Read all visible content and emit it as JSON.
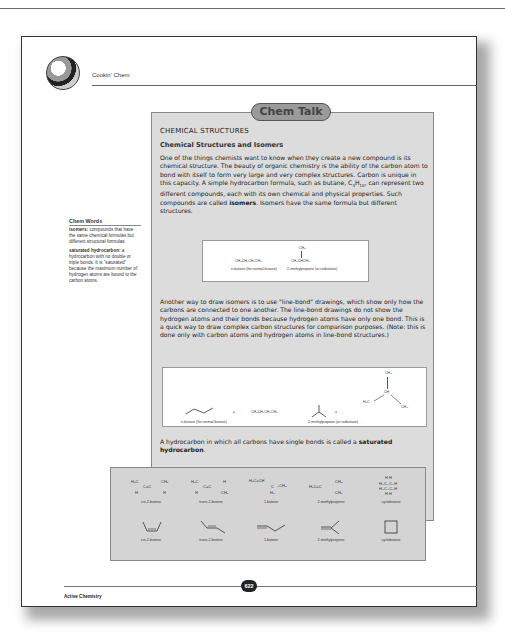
{
  "header": {
    "title": "Cookin' Chem",
    "logo_icon": "chef-knife-icon"
  },
  "chem_talk": {
    "badge": "Chem Talk",
    "section_title": "CHEMICAL STRUCTURES",
    "subsection_title": "Chemical Structures and Isomers",
    "paragraph1_a": "One of the things chemists want to know when they create a new compound is its chemical structure. The beauty of organic chemistry is the ability of the carbon atom to bond with itself to form very large and very complex structures. Carbon is unique in this capacity. A simple hydrocarbon formula, such as butane, C",
    "paragraph1_sub1": "4",
    "paragraph1_b": "H",
    "paragraph1_sub2": "10",
    "paragraph1_c": ", can represent two different compounds, each with its own chemical and physical properties. Such compounds are called ",
    "paragraph1_bold": "isomers",
    "paragraph1_d": ". Isomers have the same formula but different structures.",
    "formula_box": {
      "nbutane_formula": "CH₃CH₂CH₂CH₃",
      "nbutane_label": "n-butane (for normal butane)",
      "isobutane_top": "CH₃",
      "isobutane_formula": "CH₃CHCH₃",
      "isobutane_label": "2-methylpropane (or isobutane)"
    },
    "paragraph2": "Another way to draw isomers is to use \"line-bond\" drawings, which show only how the carbons are connected to one another. The line-bond drawings do not show the hydrogen atoms and their bonds because hydrogen atoms have only one bond. This is a quick way to draw complex carbon structures for comparison purposes. (Note: this is done only with carbon atoms and hydrogen atoms in line-bond structures.)",
    "linebond_box": {
      "equals": "=",
      "nbutane_formula": "CH₃CH₂CH₂CH₃",
      "nbutane_label": "n-butane (for normal butane)",
      "isobutane_label": "2-methylpropane (or isobutane)",
      "iso_ch3_top": "CH₃",
      "iso_ch": "CH",
      "iso_h3c": "H₃C",
      "iso_ch3_right": "CH₃"
    },
    "paragraph3_a": "A hydrocarbon in which all carbons have single bonds is called a ",
    "paragraph3_bold": "saturated hydrocarbon",
    "paragraph3_b": "."
  },
  "structures_panel": {
    "items": [
      {
        "label": "cis-2-butene",
        "line_label": "cis-2-butene"
      },
      {
        "label": "trans-2-butene",
        "line_label": "trans-2-butene"
      },
      {
        "label": "1-butene",
        "line_label": "1-butene"
      },
      {
        "label": "2-methylpropene",
        "line_label": "2-methylpropene"
      },
      {
        "label": "cyclobutane",
        "line_label": "cyclobutane"
      }
    ]
  },
  "sidebar": {
    "title": "Chem Words",
    "entries": [
      {
        "term": "isomers:",
        "definition": " compounds that have the same chemical formulas but different structural formulas."
      },
      {
        "term": "saturated hydrocarbon:",
        "definition": " a hydrocarbon with no double or triple bonds. It is \"saturated\" because the maximum number of hydrogen atoms are bound to the carbon atoms."
      }
    ]
  },
  "footer": {
    "book_title": "Active Chemistry",
    "page_number": "622"
  }
}
